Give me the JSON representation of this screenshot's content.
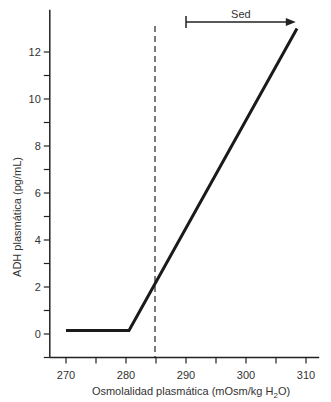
{
  "chart_data": {
    "type": "line",
    "title": "",
    "xlabel": "Osmolalidad plasmática (mOsm/kg H",
    "xlabel_sub": "2",
    "xlabel_end": "O)",
    "ylabel": "ADH plasmática (pg/mL)",
    "xlim": [
      267.3,
      312.2
    ],
    "ylim": [
      -1,
      13.8
    ],
    "x_ticks": [
      270,
      275,
      280,
      285,
      290,
      295,
      300,
      305,
      310
    ],
    "x_tick_labels": [
      "270",
      "280",
      "290",
      "300",
      "310"
    ],
    "x_tick_label_values": [
      270,
      280,
      290,
      300,
      310
    ],
    "y_ticks": [
      -1,
      0,
      1,
      2,
      3,
      4,
      5,
      6,
      7,
      8,
      9,
      10,
      11,
      12
    ],
    "y_tick_labels": [
      "0",
      "2",
      "4",
      "6",
      "8",
      "10",
      "12"
    ],
    "y_tick_label_values": [
      0,
      2,
      4,
      6,
      8,
      10,
      12
    ],
    "grid": false,
    "legend": null,
    "series": [
      {
        "name": "ADH plasmática",
        "x": [
          270,
          280.5,
          308.5
        ],
        "y": [
          0.15,
          0.15,
          13.0
        ]
      }
    ],
    "annotations": [
      {
        "type": "vline",
        "x": 285,
        "style": "dashed",
        "label": "umbral osmótico"
      },
      {
        "type": "arrow",
        "label": "Sed",
        "x_start": 290,
        "x_end": 308.3,
        "y": 13.4
      }
    ]
  }
}
